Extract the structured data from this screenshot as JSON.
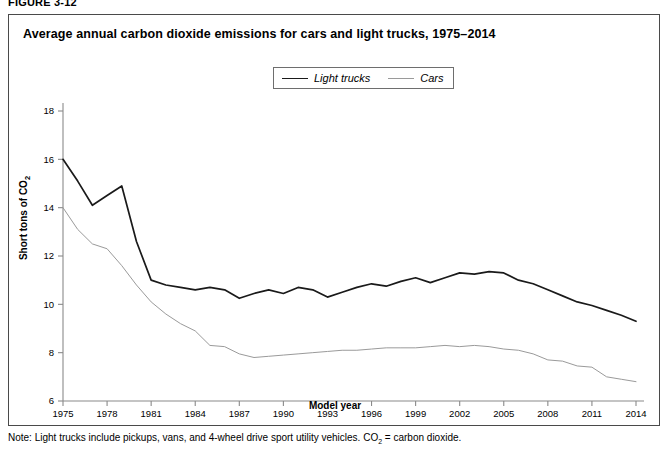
{
  "figure": {
    "label": "FIGURE 3-12",
    "title": "Average annual carbon dioxide emissions for cars and light trucks, 1975–2014",
    "note_prefix": "Note: Light trucks include pickups, vans, and 4-wheel drive sport utility vehicles. CO",
    "note_sub": "2",
    "note_suffix": " = carbon dioxide."
  },
  "legend": {
    "position": "top-center",
    "items": [
      {
        "label": "Light trucks",
        "color": "#1a1a1a",
        "style": "solid"
      },
      {
        "label": "Cars",
        "color": "#9a9a9a",
        "style": "solid-light"
      }
    ]
  },
  "axis": {
    "ylabel_text": "Short tons of CO",
    "ylabel_sub": "2",
    "xlabel": "Model year"
  },
  "chart_data": {
    "type": "line",
    "title": "Average annual carbon dioxide emissions for cars and light trucks, 1975–2014",
    "xlabel": "Model year",
    "ylabel": "Short tons of CO2",
    "xlim": [
      1975,
      2014
    ],
    "ylim": [
      6,
      18
    ],
    "yticks": [
      6,
      8,
      10,
      12,
      14,
      16,
      18
    ],
    "xticks": [
      1975,
      1978,
      1981,
      1984,
      1987,
      1990,
      1993,
      1996,
      1999,
      2002,
      2005,
      2008,
      2011,
      2014
    ],
    "grid": false,
    "legend_position": "top-center",
    "x": [
      1975,
      1976,
      1977,
      1978,
      1979,
      1980,
      1981,
      1982,
      1983,
      1984,
      1985,
      1986,
      1987,
      1988,
      1989,
      1990,
      1991,
      1992,
      1993,
      1994,
      1995,
      1996,
      1997,
      1998,
      1999,
      2000,
      2001,
      2002,
      2003,
      2004,
      2005,
      2006,
      2007,
      2008,
      2009,
      2010,
      2011,
      2012,
      2013,
      2014
    ],
    "series": [
      {
        "name": "Light trucks",
        "color": "#1a1a1a",
        "values": [
          16.0,
          15.1,
          14.1,
          14.5,
          14.9,
          12.6,
          11.0,
          10.8,
          10.7,
          10.6,
          10.7,
          10.6,
          10.25,
          10.45,
          10.6,
          10.45,
          10.7,
          10.6,
          10.3,
          10.5,
          10.7,
          10.85,
          10.75,
          10.95,
          11.1,
          10.9,
          11.1,
          11.3,
          11.25,
          11.35,
          11.3,
          11.0,
          10.85,
          10.6,
          10.35,
          10.1,
          9.95,
          9.75,
          9.55,
          9.3
        ]
      },
      {
        "name": "Cars",
        "color": "#9a9a9a",
        "values": [
          14.0,
          13.1,
          12.5,
          12.3,
          11.6,
          10.8,
          10.1,
          9.6,
          9.2,
          8.9,
          8.3,
          8.25,
          7.95,
          7.8,
          7.85,
          7.9,
          7.95,
          8.0,
          8.05,
          8.1,
          8.1,
          8.15,
          8.2,
          8.2,
          8.2,
          8.25,
          8.3,
          8.25,
          8.3,
          8.25,
          8.15,
          8.1,
          7.95,
          7.7,
          7.65,
          7.45,
          7.4,
          7.0,
          6.9,
          6.8
        ]
      }
    ]
  }
}
